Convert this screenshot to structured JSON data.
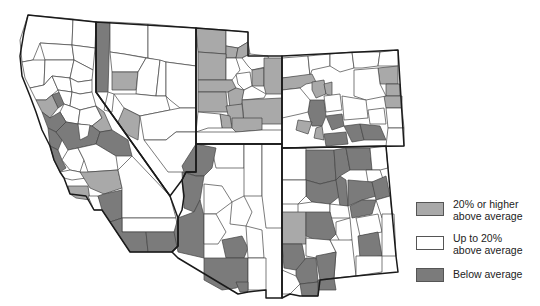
{
  "legend": {
    "colors": {
      "high": "#a9a9a9",
      "mid": "#ffffff",
      "low": "#7b7b7b"
    },
    "items": [
      {
        "key": "high",
        "label_line1": "20% or higher",
        "label_line2": "above average"
      },
      {
        "key": "mid",
        "label_line1": "Up to 20%",
        "label_line2": "above average"
      },
      {
        "key": "low",
        "label_line1": "Below average",
        "label_line2": ""
      }
    ]
  },
  "map": {
    "region": "Southwestern United States by county",
    "states": [
      "California",
      "Nevada",
      "Utah",
      "Colorado",
      "Arizona",
      "New Mexico"
    ]
  }
}
